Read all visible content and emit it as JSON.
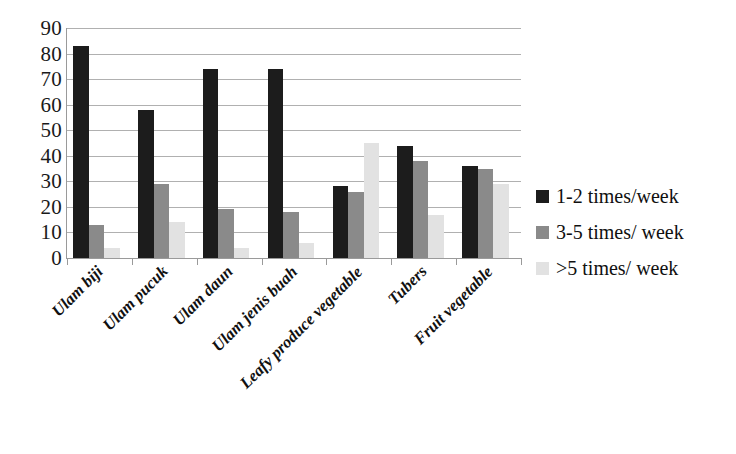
{
  "chart_data": {
    "type": "bar",
    "title": "",
    "subtitle": "",
    "xlabel": "",
    "ylabel": "",
    "ylim": [
      0,
      90
    ],
    "ytick_step": 10,
    "yticks": [
      90,
      80,
      70,
      60,
      50,
      40,
      30,
      20,
      10,
      0
    ],
    "ytick_labels": [
      "90",
      "80",
      "70",
      "60",
      "50",
      "40",
      "30",
      "20",
      "10",
      "0"
    ],
    "grid": true,
    "grid_axis": "y",
    "legend_position": "right",
    "categories": [
      "Ulam biji",
      "Ulam pucuk",
      "Ulam daun",
      "Ulam jenis buah",
      "Leafy produce vegetable",
      "Tubers",
      "Fruit vegetable"
    ],
    "series": [
      {
        "name": "1-2 times/week",
        "color": "#1c1c1c",
        "values": [
          83,
          58,
          74,
          74,
          28,
          44,
          36
        ]
      },
      {
        "name": "3-5 times/ week",
        "color": "#8a8a8a",
        "values": [
          13,
          29,
          19,
          18,
          26,
          38,
          35
        ]
      },
      {
        "name": ">5 times/ week",
        "color": "#e2e2e2",
        "values": [
          4,
          14,
          4,
          6,
          45,
          17,
          29
        ]
      }
    ],
    "annotations": []
  },
  "legend": {
    "items": [
      {
        "label": "1-2 times/week",
        "color": "#1c1c1c"
      },
      {
        "label": "3-5 times/ week",
        "color": "#8a8a8a"
      },
      {
        "label": ">5 times/ week",
        "color": "#e2e2e2"
      }
    ]
  },
  "colors": {
    "axis": "#9a9a9a",
    "gridline": "#b0b0b0",
    "text": "#101010",
    "background": "#ffffff",
    "series_1": "#1c1c1c",
    "series_2": "#8a8a8a",
    "series_3": "#e2e2e2"
  }
}
